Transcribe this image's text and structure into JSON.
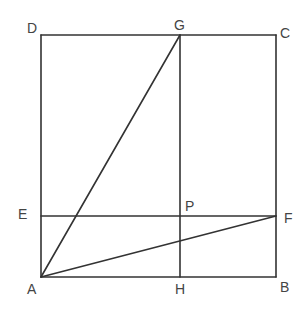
{
  "diagram": {
    "type": "geometry",
    "stroke_color": "#333333",
    "label_color": "#444444",
    "points": {
      "A": {
        "label": "A",
        "x": 41,
        "y": 277
      },
      "B": {
        "label": "B",
        "x": 276,
        "y": 277
      },
      "C": {
        "label": "C",
        "x": 276,
        "y": 35
      },
      "D": {
        "label": "D",
        "x": 41,
        "y": 35
      },
      "E": {
        "label": "E",
        "x": 41,
        "y": 216
      },
      "F": {
        "label": "F",
        "x": 276,
        "y": 216
      },
      "G": {
        "label": "G",
        "x": 180,
        "y": 35
      },
      "H": {
        "label": "H",
        "x": 180,
        "y": 277
      },
      "P": {
        "label": "P",
        "x": 180,
        "y": 216
      }
    },
    "segments": [
      [
        "A",
        "B"
      ],
      [
        "B",
        "C"
      ],
      [
        "C",
        "D"
      ],
      [
        "D",
        "A"
      ],
      [
        "G",
        "H"
      ],
      [
        "E",
        "F"
      ],
      [
        "A",
        "G"
      ],
      [
        "A",
        "F"
      ]
    ]
  }
}
